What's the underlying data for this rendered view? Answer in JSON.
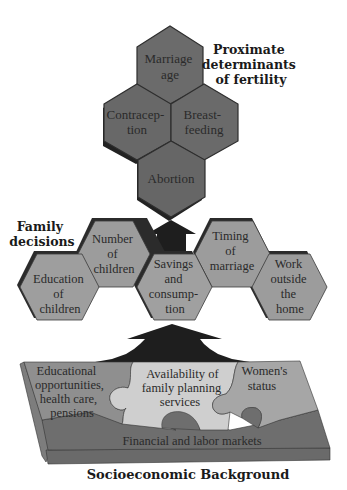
{
  "colors": {
    "proximate_fill": "#6b6b6b",
    "proximate_stroke": "#2e2e2e",
    "family_fill": "#9c9c9c",
    "family_shadow": "#2b2b2b",
    "arrow": "#1e1e1e",
    "puzzle_left": "#8f8f8f",
    "puzzle_center": "#cfcfcf",
    "puzzle_right": "#a6a6a6",
    "markets": "#6e6e6e",
    "slab_side": "#7d7d7d"
  },
  "proximate": {
    "title_lines": [
      "Proximate",
      "determinants",
      "of fertility"
    ],
    "hexagons": [
      {
        "id": "marriage-age",
        "lines": [
          "Marriage",
          "age"
        ]
      },
      {
        "id": "contraception",
        "lines": [
          "Contracep-",
          "tion"
        ]
      },
      {
        "id": "breastfeeding",
        "lines": [
          "Breast-",
          "feeding"
        ]
      },
      {
        "id": "abortion",
        "lines": [
          "Abortion"
        ]
      }
    ]
  },
  "family": {
    "title_lines": [
      "Family",
      "decisions"
    ],
    "hexagons": [
      {
        "id": "education-of-children",
        "lines": [
          "Education",
          "of",
          "children"
        ]
      },
      {
        "id": "number-of-children",
        "lines": [
          "Number",
          "of",
          "children"
        ]
      },
      {
        "id": "savings-and-consumption",
        "lines": [
          "Savings",
          "and",
          "consump-",
          "tion"
        ]
      },
      {
        "id": "timing-of-marriage",
        "lines": [
          "Timing",
          "of",
          "marriage"
        ]
      },
      {
        "id": "work-outside-home",
        "lines": [
          "Work",
          "outside",
          "the",
          "home"
        ]
      }
    ]
  },
  "background": {
    "pieces": [
      {
        "id": "educational-opportunities",
        "lines": [
          "Educational",
          "opportunities,",
          "health care,",
          "pensions"
        ]
      },
      {
        "id": "family-planning",
        "lines": [
          "Availability  of",
          "family planning",
          "services"
        ]
      },
      {
        "id": "womens-status",
        "lines": [
          "Women's",
          "status"
        ]
      }
    ],
    "base_label": "Financial and labor markets",
    "title": "Socioeconomic  Background"
  }
}
